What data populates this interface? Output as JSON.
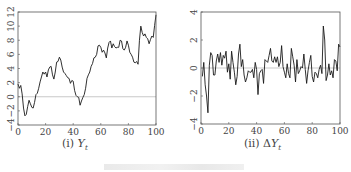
{
  "figure": {
    "panels": [
      {
        "id": "left",
        "caption_prefix": "(i) ",
        "caption_var": "Y",
        "caption_sub": "t",
        "frame": {
          "x0": 18,
          "y0": 12,
          "x1": 156,
          "y1": 125
        },
        "xlim": [
          0,
          100
        ],
        "ylim": [
          -4,
          12
        ],
        "xticks": [
          0,
          20,
          40,
          60,
          80,
          100
        ],
        "yticks": [
          -4,
          -2,
          0,
          2,
          4,
          6,
          8,
          10,
          12
        ],
        "ytick_labels": [
          "−4",
          "−2",
          "0",
          "2",
          "4",
          "6",
          "8",
          "10",
          "12"
        ],
        "zero_line": true
      },
      {
        "id": "right",
        "caption_prefix": "(ii) Δ",
        "caption_var": "Y",
        "caption_sub": "t",
        "frame": {
          "x0": 201,
          "y0": 12,
          "x1": 340,
          "y1": 124
        },
        "xlim": [
          0,
          100
        ],
        "ylim": [
          -4,
          4
        ],
        "xticks": [
          0,
          20,
          40,
          60,
          80,
          100
        ],
        "yticks": [
          -4,
          -2,
          0,
          2,
          4
        ],
        "ytick_labels": [
          "−4",
          "−2",
          "0",
          "2",
          "4"
        ],
        "zero_line": true
      }
    ],
    "line_color": "#1a1a1a",
    "frame_color": "#555555",
    "zero_line_color": "#bbbbbb",
    "figure_caption": ""
  },
  "chart_data": [
    {
      "type": "line",
      "title": "(i) Y_t",
      "xlabel": "",
      "ylabel": "",
      "xlim": [
        0,
        100
      ],
      "ylim": [
        -4,
        12
      ],
      "grid": false,
      "reference_line_y": 0,
      "x": [
        0,
        1,
        2,
        3,
        4,
        5,
        6,
        7,
        8,
        9,
        10,
        11,
        12,
        13,
        14,
        15,
        16,
        17,
        18,
        19,
        20,
        21,
        22,
        23,
        24,
        25,
        26,
        27,
        28,
        29,
        30,
        31,
        32,
        33,
        34,
        35,
        36,
        37,
        38,
        39,
        40,
        41,
        42,
        43,
        44,
        45,
        46,
        47,
        48,
        49,
        50,
        51,
        52,
        53,
        54,
        55,
        56,
        57,
        58,
        59,
        60,
        61,
        62,
        63,
        64,
        65,
        66,
        67,
        68,
        69,
        70,
        71,
        72,
        73,
        74,
        75,
        76,
        77,
        78,
        79,
        80,
        81,
        82,
        83,
        84,
        85,
        86,
        87,
        88,
        89,
        90,
        91,
        92,
        93,
        94,
        95,
        96,
        97,
        98,
        99,
        100
      ],
      "series": [
        {
          "name": "Y_t",
          "values": [
            1.8,
            1.2,
            1.6,
            0.4,
            -1.6,
            -2.7,
            -2.5,
            -1.4,
            -0.5,
            -1.0,
            -1.5,
            -1.6,
            -0.8,
            0.3,
            0.5,
            1.2,
            2.1,
            2.8,
            3.5,
            3.2,
            3.5,
            2.8,
            3.8,
            4.2,
            4.3,
            3.1,
            2.5,
            3.5,
            4.9,
            5.0,
            5.6,
            5.2,
            4.2,
            3.5,
            3.3,
            3.0,
            2.7,
            2.6,
            1.9,
            2.3,
            2.2,
            0.9,
            0.2,
            0.0,
            -0.1,
            -1.2,
            -0.6,
            -0.1,
            0.3,
            1.2,
            2.6,
            3.1,
            3.5,
            4.3,
            4.7,
            5.5,
            5.6,
            6.0,
            7.2,
            7.3,
            7.0,
            6.3,
            6.6,
            6.2,
            5.5,
            6.9,
            7.7,
            7.9,
            6.9,
            7.5,
            7.1,
            6.9,
            7.0,
            7.0,
            8.0,
            7.9,
            6.8,
            6.6,
            7.0,
            7.9,
            7.3,
            6.3,
            6.0,
            5.6,
            4.9,
            4.8,
            5.0,
            4.6,
            8.0,
            10.0,
            9.1,
            8.6,
            8.9,
            8.4,
            8.2,
            7.5,
            8.1,
            8.6,
            8.4,
            10.1,
            11.6
          ]
        }
      ]
    },
    {
      "type": "line",
      "title": "(ii) ΔY_t",
      "xlabel": "",
      "ylabel": "",
      "xlim": [
        0,
        100
      ],
      "ylim": [
        -4,
        4
      ],
      "grid": false,
      "reference_line_y": 0,
      "x": [
        1,
        2,
        3,
        4,
        5,
        6,
        7,
        8,
        9,
        10,
        11,
        12,
        13,
        14,
        15,
        16,
        17,
        18,
        19,
        20,
        21,
        22,
        23,
        24,
        25,
        26,
        27,
        28,
        29,
        30,
        31,
        32,
        33,
        34,
        35,
        36,
        37,
        38,
        39,
        40,
        41,
        42,
        43,
        44,
        45,
        46,
        47,
        48,
        49,
        50,
        51,
        52,
        53,
        54,
        55,
        56,
        57,
        58,
        59,
        60,
        61,
        62,
        63,
        64,
        65,
        66,
        67,
        68,
        69,
        70,
        71,
        72,
        73,
        74,
        75,
        76,
        77,
        78,
        79,
        80,
        81,
        82,
        83,
        84,
        85,
        86,
        87,
        88,
        89,
        90,
        91,
        92,
        93,
        94,
        95,
        96,
        97,
        98,
        99,
        100
      ],
      "series": [
        {
          "name": "ΔY_t",
          "values": [
            -0.6,
            0.4,
            -1.2,
            -2.0,
            -3.2,
            0.2,
            1.1,
            0.9,
            -0.5,
            -0.5,
            0.5,
            1.0,
            0.4,
            1.1,
            0.2,
            0.9,
            0.7,
            1.2,
            -0.3,
            0.3,
            -0.8,
            1.2,
            0.4,
            -0.3,
            -1.2,
            -0.6,
            1.0,
            1.7,
            0.1,
            0.6,
            -0.5,
            -1.0,
            -0.7,
            -0.2,
            -0.3,
            -0.3,
            -0.1,
            -0.7,
            0.4,
            -0.1,
            -1.9,
            -0.4,
            -0.2,
            -0.1,
            -1.1,
            0.6,
            0.5,
            0.4,
            0.9,
            1.4,
            0.5,
            0.4,
            0.8,
            0.4,
            0.8,
            0.1,
            0.4,
            1.6,
            0.1,
            -0.3,
            -0.7,
            0.3,
            -0.4,
            -0.7,
            1.4,
            0.8,
            0.2,
            -1.0,
            0.6,
            -0.4,
            -0.2,
            0.1,
            0.0,
            1.0,
            -0.1,
            -1.1,
            -0.2,
            0.4,
            0.9,
            -0.6,
            -1.0,
            -0.3,
            -0.4,
            -0.7,
            -0.1,
            0.2,
            -0.4,
            3.0,
            2.0,
            -0.9,
            -0.5,
            0.3,
            -0.5,
            -0.2,
            -0.7,
            0.6,
            0.5,
            -0.2,
            1.7,
            1.5
          ]
        }
      ]
    }
  ]
}
